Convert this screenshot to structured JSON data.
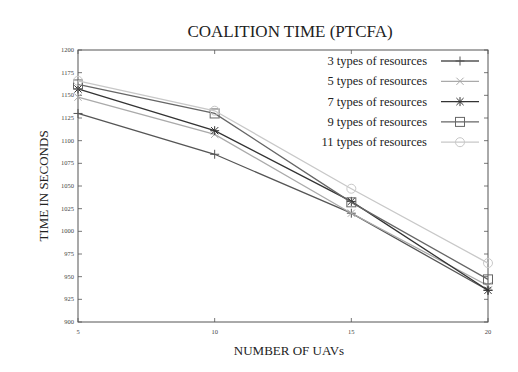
{
  "chart_data": {
    "type": "line",
    "title": "COALITION TIME (PTCFA)",
    "xlabel": "NUMBER OF UAVs",
    "ylabel": "TIME IN SECONDS",
    "x": [
      5,
      10,
      15,
      20
    ],
    "xticks": [
      "5",
      "10",
      "15",
      "20"
    ],
    "yticks": [
      "900",
      "925",
      "950",
      "975",
      "1000",
      "1025",
      "1050",
      "1075",
      "1100",
      "1125",
      "1150",
      "1175",
      "1200"
    ],
    "ylim": [
      900,
      1200
    ],
    "xlim": [
      5,
      20
    ],
    "grid": false,
    "legend_position": "top-right",
    "series": [
      {
        "name": "3 types of resources",
        "marker": "plus",
        "color": "#555555",
        "values": [
          1130,
          1085,
          1020,
          935
        ]
      },
      {
        "name": "5 types of resources",
        "marker": "x",
        "color": "#aaaaaa",
        "values": [
          1148,
          1107,
          1020,
          940
        ]
      },
      {
        "name": "7 types of resources",
        "marker": "star",
        "color": "#333333",
        "values": [
          1157,
          1111,
          1033,
          935
        ]
      },
      {
        "name": "9 types of resources",
        "marker": "square",
        "color": "#666666",
        "values": [
          1162,
          1130,
          1032,
          947
        ]
      },
      {
        "name": "11 types of resources",
        "marker": "diamond",
        "color": "#c8c8c8",
        "values": [
          1166,
          1133,
          1047,
          965
        ]
      }
    ]
  }
}
